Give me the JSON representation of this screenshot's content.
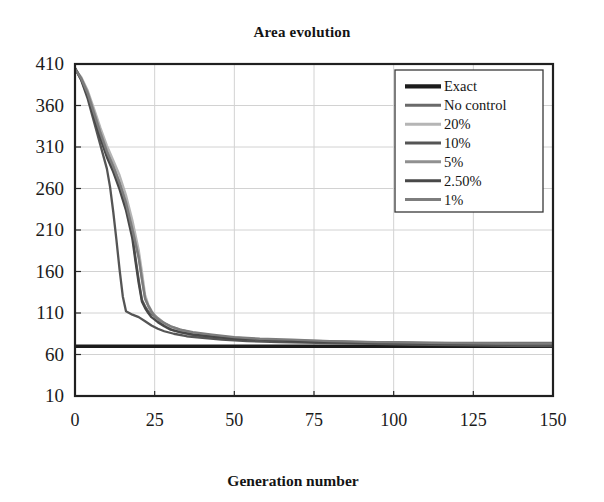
{
  "chart_data": {
    "type": "line",
    "title": "Area evolution",
    "xlabel": "Generation number",
    "ylabel": "",
    "xlim": [
      0,
      150
    ],
    "ylim": [
      10,
      410
    ],
    "xticks": [
      0,
      25,
      50,
      75,
      100,
      125,
      150
    ],
    "yticks": [
      10,
      60,
      110,
      160,
      210,
      260,
      310,
      360,
      410
    ],
    "grid": true,
    "legend_position": "top-right",
    "series": [
      {
        "name": "Exact",
        "color": "#1c1c1c",
        "width": 3.4,
        "x": [
          0,
          150
        ],
        "values": [
          70,
          70
        ]
      },
      {
        "name": "No control",
        "color": "#6a6a6a",
        "width": 2.3,
        "x": [
          0,
          2,
          4,
          6,
          8,
          10,
          12,
          14,
          16,
          18,
          19,
          20,
          21,
          22,
          23,
          25,
          27,
          29,
          31,
          34,
          38,
          42,
          47,
          53,
          60,
          70,
          82,
          95,
          110,
          130,
          150
        ],
        "values": [
          405,
          392,
          372,
          347,
          322,
          300,
          282,
          262,
          238,
          205,
          176,
          150,
          126,
          118,
          112,
          106,
          99,
          93,
          89,
          86,
          83,
          81,
          79,
          78,
          77,
          76,
          75,
          75,
          74,
          74,
          74
        ]
      },
      {
        "name": "20%",
        "color": "#b5b5b5",
        "width": 2.2,
        "x": [
          0,
          2,
          4,
          6,
          8,
          10,
          12,
          14,
          16,
          18,
          20,
          21,
          22,
          23,
          24,
          25,
          27,
          29,
          32,
          36,
          40,
          45,
          52,
          60,
          72,
          86,
          100,
          120,
          150
        ],
        "values": [
          404,
          394,
          378,
          356,
          333,
          312,
          294,
          276,
          252,
          222,
          186,
          160,
          132,
          120,
          113,
          107,
          100,
          95,
          90,
          86,
          83,
          81,
          79,
          77,
          76,
          75,
          74,
          73,
          72
        ]
      },
      {
        "name": "10%",
        "color": "#555555",
        "width": 2.3,
        "x": [
          0,
          2,
          4,
          6,
          8,
          10,
          11,
          12,
          13,
          14,
          15,
          16,
          18,
          20,
          22,
          24,
          26,
          28,
          31,
          35,
          40,
          46,
          54,
          64,
          76,
          90,
          105,
          125,
          150
        ],
        "values": [
          405,
          390,
          368,
          340,
          312,
          284,
          262,
          232,
          198,
          162,
          130,
          112,
          108,
          105,
          100,
          95,
          91,
          88,
          85,
          82,
          80,
          78,
          76,
          75,
          74,
          73,
          72,
          71,
          70
        ]
      },
      {
        "name": "5%",
        "color": "#909090",
        "width": 2.2,
        "x": [
          0,
          2,
          4,
          6,
          8,
          10,
          12,
          14,
          16,
          18,
          20,
          21,
          22,
          23,
          24,
          26,
          28,
          30,
          33,
          37,
          42,
          48,
          56,
          66,
          78,
          92,
          110,
          130,
          150
        ],
        "values": [
          404,
          393,
          376,
          352,
          328,
          306,
          288,
          268,
          244,
          212,
          178,
          152,
          128,
          118,
          111,
          104,
          98,
          94,
          90,
          86,
          83,
          81,
          79,
          77,
          76,
          75,
          74,
          73,
          72
        ]
      },
      {
        "name": "2.50%",
        "color": "#484848",
        "width": 2.4,
        "x": [
          0,
          2,
          4,
          6,
          8,
          10,
          12,
          14,
          16,
          18,
          19,
          20,
          21,
          22,
          23,
          24,
          26,
          28,
          30,
          33,
          37,
          42,
          50,
          58,
          70,
          84,
          100,
          122,
          150
        ],
        "values": [
          405,
          391,
          371,
          345,
          320,
          298,
          280,
          259,
          234,
          200,
          172,
          146,
          124,
          116,
          110,
          105,
          99,
          94,
          90,
          87,
          84,
          82,
          79,
          78,
          76,
          75,
          74,
          73,
          72
        ]
      },
      {
        "name": "1%",
        "color": "#7d7d7d",
        "width": 2.3,
        "x": [
          0,
          2,
          4,
          6,
          8,
          10,
          12,
          14,
          16,
          18,
          20,
          21,
          22,
          23,
          24,
          25,
          27,
          30,
          33,
          37,
          43,
          50,
          58,
          68,
          80,
          95,
          112,
          132,
          150
        ],
        "values": [
          404,
          392,
          374,
          350,
          326,
          304,
          286,
          266,
          242,
          210,
          176,
          150,
          127,
          119,
          112,
          106,
          100,
          94,
          90,
          87,
          84,
          81,
          79,
          78,
          76,
          75,
          74,
          73,
          73
        ]
      }
    ],
    "legend_entries": [
      "Exact",
      "No control",
      "20%",
      "10%",
      "5%",
      "2.50%",
      "1%"
    ]
  }
}
